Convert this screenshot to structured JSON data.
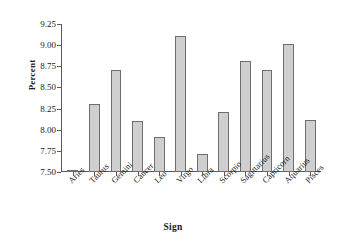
{
  "chart_data": {
    "type": "bar",
    "title": "",
    "xlabel": "Sign",
    "ylabel": "Percent",
    "categories": [
      "Aries",
      "Taurus",
      "Gemini",
      "Cancer",
      "Leo",
      "Virgo",
      "Libra",
      "Scorpio",
      "Sagittarius",
      "Capricorn",
      "Aquarius",
      "Pisces"
    ],
    "values": [
      7.5,
      8.3,
      8.71,
      8.1,
      7.91,
      9.11,
      7.71,
      8.21,
      8.81,
      8.71,
      9.01,
      8.11
    ],
    "ylim": [
      7.5,
      9.25
    ],
    "ytick_labels": [
      "9.25",
      "9.00",
      "8.75",
      "8.50",
      "8.25",
      "8.00",
      "7.75",
      "7.50"
    ],
    "ytick_values": [
      9.25,
      9.0,
      8.75,
      8.5,
      8.25,
      8.0,
      7.75,
      7.5
    ],
    "grid": false,
    "legend": false,
    "bar_fill_color": "#cfcfcf",
    "bar_border_color": "#6e6e6e",
    "axis_color": "#5a5a5a",
    "background_color": "#ffffff"
  }
}
